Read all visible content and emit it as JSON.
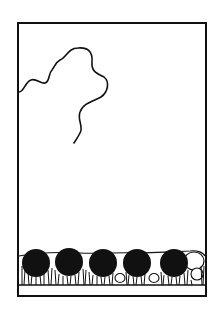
{
  "figure": {
    "colors": {
      "background": "#ffffff",
      "ink": "#111111"
    },
    "frame": {
      "x": 18,
      "y": 23,
      "width": 188,
      "height": 273
    },
    "ground_line_y": 285,
    "spheres": [
      {
        "cx": 36,
        "cy": 263,
        "r": 14
      },
      {
        "cx": 69,
        "cy": 262,
        "r": 14
      },
      {
        "cx": 103,
        "cy": 263,
        "r": 14
      },
      {
        "cx": 137,
        "cy": 263,
        "r": 14
      },
      {
        "cx": 174,
        "cy": 263,
        "r": 14
      }
    ]
  }
}
